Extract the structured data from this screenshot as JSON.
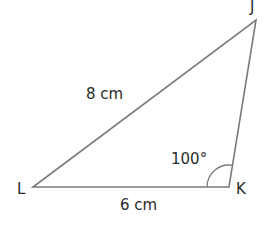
{
  "diagram": {
    "type": "triangle",
    "vertices": {
      "J": {
        "label": "J",
        "x": 256,
        "y": 20
      },
      "K": {
        "label": "K",
        "x": 229,
        "y": 187
      },
      "L": {
        "label": "L",
        "x": 33,
        "y": 187
      }
    },
    "sides": {
      "LJ": {
        "label": "8 cm"
      },
      "LK": {
        "label": "6 cm"
      }
    },
    "angles": {
      "K": {
        "label": "100°"
      }
    },
    "colors": {
      "line": "#7a7a7a",
      "text": "#2b2b2b",
      "background": "#ffffff"
    }
  }
}
